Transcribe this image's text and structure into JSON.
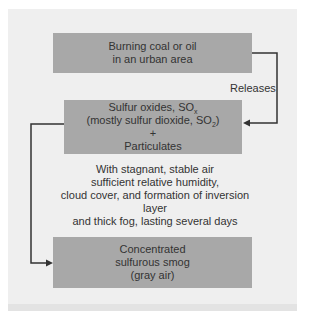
{
  "diagram": {
    "colors": {
      "panel_bg": "#efefef",
      "box_fill": "#a8a8a8",
      "text": "#333333",
      "connector": "#333333"
    },
    "nodes": [
      {
        "id": "burning",
        "lines": [
          "Burning coal or oil",
          "in an urban area"
        ]
      },
      {
        "id": "sulfur-oxides",
        "line1_main": "Sulfur oxides, SO",
        "line1_sub": "x",
        "line2_main": "(mostly sulfur dioxide, SO",
        "line2_sub": "2",
        "line2_end": ")",
        "line3": "+",
        "line4": "Particulates"
      },
      {
        "id": "smog",
        "lines": [
          "Concentrated",
          "sulfurous smog",
          "(gray air)"
        ]
      }
    ],
    "edges": [
      {
        "from": "burning",
        "to": "sulfur-oxides",
        "label": "Releases"
      },
      {
        "from": "sulfur-oxides",
        "to": "smog",
        "label_lines": [
          "With stagnant, stable air",
          "sufficient relative humidity,",
          "cloud cover, and formation of inversion layer",
          "and thick fog, lasting several days"
        ]
      }
    ]
  }
}
